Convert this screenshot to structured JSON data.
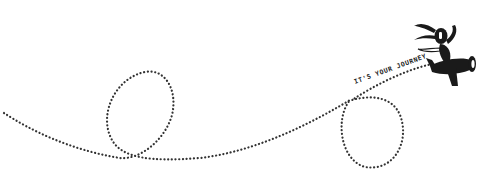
{
  "illustration": {
    "tagline": "IT'S YOUR JOURNEY",
    "figure": "character-riding-airplane",
    "path_style": "dotted",
    "colors": {
      "background": "#ffffff",
      "ink": "#1a1a1a",
      "dots": "#333333"
    }
  }
}
